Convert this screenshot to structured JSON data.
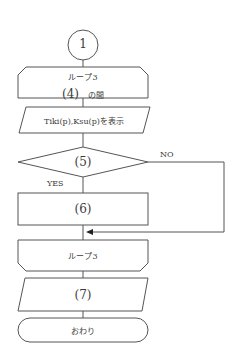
{
  "diagram": {
    "connector": {
      "label": "1"
    },
    "loop_start": {
      "line1": "ループ3",
      "line2_num": "(4)",
      "line2_suffix": "の間"
    },
    "output1": {
      "label": "Tiki(p),Ksu(p)を表示"
    },
    "decision": {
      "label": "(5)",
      "yes_label": "YES",
      "no_label": "NO"
    },
    "process": {
      "label": "(6)"
    },
    "loop_end": {
      "label": "ループ3"
    },
    "output2": {
      "label": "(7)"
    },
    "terminal": {
      "label": "おわり"
    }
  },
  "colors": {
    "stroke": "#555555",
    "text": "#3a3a3a",
    "background": "#ffffff"
  }
}
